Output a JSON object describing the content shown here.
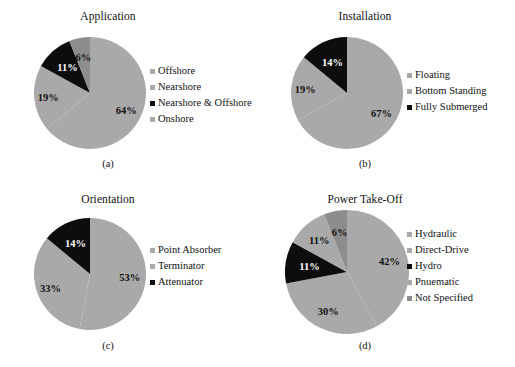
{
  "figure": {
    "background": "#ffffff",
    "palette": {
      "light_gray": "#a9a9a9",
      "mid_gray": "#a4a4a4",
      "dark_gray": "#888888",
      "black": "#0d0d0d",
      "text": "#111111",
      "label_light": "#111111",
      "label_on_black": "#ffffff"
    }
  },
  "chart_data": [
    {
      "id": "a",
      "type": "pie",
      "title": "Application",
      "caption": "(a)",
      "xlabel": "",
      "ylabel": "",
      "legend_position": "right",
      "grid": false,
      "start_angle_deg": 0,
      "direction": "clockwise",
      "categories": [
        "Offshore",
        "Nearshore",
        "Nearshore & Offshore",
        "Onshore"
      ],
      "values": [
        64,
        19,
        11,
        6
      ],
      "value_labels": [
        "64%",
        "19%",
        "11%",
        "6%"
      ],
      "colors": [
        "#a9a9a9",
        "#a9a9a9",
        "#0d0d0d",
        "#8d8d8d"
      ],
      "label_colors": [
        "#111111",
        "#111111",
        "#ffffff",
        "#111111"
      ],
      "legend": [
        {
          "label": "Offshore",
          "color": "#a9a9a9"
        },
        {
          "label": "Nearshore",
          "color": "#a9a9a9"
        },
        {
          "label": "Nearshore & Offshore",
          "color": "#0d0d0d"
        },
        {
          "label": "Onshore",
          "color": "#a9a9a9"
        }
      ]
    },
    {
      "id": "b",
      "type": "pie",
      "title": "Installation",
      "caption": "(b)",
      "xlabel": "",
      "ylabel": "",
      "legend_position": "right",
      "grid": false,
      "start_angle_deg": 0,
      "direction": "clockwise",
      "categories": [
        "Floating",
        "Bottom Standing",
        "Fully Submerged"
      ],
      "values": [
        67,
        19,
        14
      ],
      "value_labels": [
        "67%",
        "19%",
        "14%"
      ],
      "colors": [
        "#a9a9a9",
        "#a9a9a9",
        "#0d0d0d"
      ],
      "label_colors": [
        "#111111",
        "#111111",
        "#ffffff"
      ],
      "legend": [
        {
          "label": "Floating",
          "color": "#a9a9a9"
        },
        {
          "label": "Bottom Standing",
          "color": "#a9a9a9"
        },
        {
          "label": "Fully Submerged",
          "color": "#0d0d0d"
        }
      ]
    },
    {
      "id": "c",
      "type": "pie",
      "title": "Orientation",
      "caption": "(c)",
      "xlabel": "",
      "ylabel": "",
      "legend_position": "right",
      "grid": false,
      "start_angle_deg": 0,
      "direction": "clockwise",
      "categories": [
        "Point Absorber",
        "Terminator",
        "Attenuator"
      ],
      "values": [
        53,
        33,
        14
      ],
      "value_labels": [
        "53%",
        "33%",
        "14%"
      ],
      "colors": [
        "#a9a9a9",
        "#a9a9a9",
        "#0d0d0d"
      ],
      "label_colors": [
        "#111111",
        "#111111",
        "#ffffff"
      ],
      "legend": [
        {
          "label": "Point Absorber",
          "color": "#a9a9a9"
        },
        {
          "label": "Terminator",
          "color": "#a9a9a9"
        },
        {
          "label": "Attenuator",
          "color": "#0d0d0d"
        }
      ]
    },
    {
      "id": "d",
      "type": "pie",
      "title": "Power Take-Off",
      "caption": "(d)",
      "xlabel": "",
      "ylabel": "",
      "legend_position": "right",
      "grid": false,
      "start_angle_deg": 0,
      "direction": "clockwise",
      "categories": [
        "Hydraulic",
        "Direct-Drive",
        "Hydro",
        "Pnuematic",
        "Not Specified"
      ],
      "values": [
        42,
        30,
        11,
        11,
        6
      ],
      "value_labels": [
        "42%",
        "30%",
        "11%",
        "11%",
        "6%"
      ],
      "colors": [
        "#a9a9a9",
        "#a9a9a9",
        "#0d0d0d",
        "#a9a9a9",
        "#8d8d8d"
      ],
      "label_colors": [
        "#111111",
        "#111111",
        "#ffffff",
        "#111111",
        "#111111"
      ],
      "legend": [
        {
          "label": "Hydraulic",
          "color": "#a9a9a9"
        },
        {
          "label": "Direct-Drive",
          "color": "#a9a9a9"
        },
        {
          "label": "Hydro",
          "color": "#0d0d0d"
        },
        {
          "label": "Pnuematic",
          "color": "#a9a9a9"
        },
        {
          "label": "Not Specified",
          "color": "#8d8d8d"
        }
      ]
    }
  ]
}
